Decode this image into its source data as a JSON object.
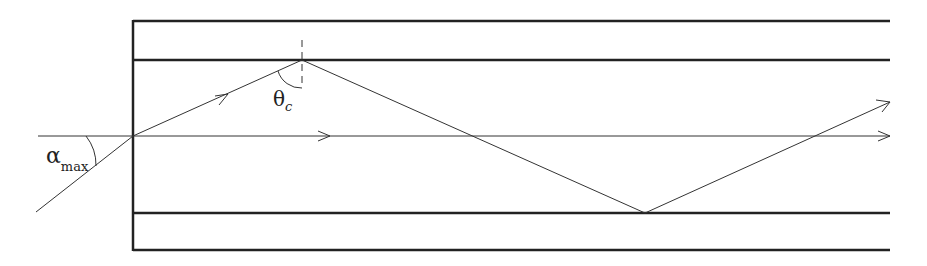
{
  "diagram": {
    "labels": {
      "alpha_symbol": "α",
      "alpha_subscript": "max",
      "theta_symbol": "θ",
      "theta_subscript": "c"
    },
    "colors": {
      "stroke": "#222222",
      "background": "#ffffff"
    },
    "geometry": {
      "left_x": 133,
      "right_x": 890,
      "cladding_top_y": 21,
      "core_top_y": 60,
      "axis_y": 136,
      "core_bottom_y": 213,
      "cladding_bottom_y": 250
    }
  }
}
